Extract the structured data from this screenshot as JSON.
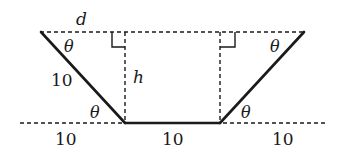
{
  "diagram": {
    "type": "geometry-trapezoid",
    "labels": {
      "top_width": "d",
      "height": "h",
      "slant_side": "10",
      "angle_top_left": "θ",
      "angle_bottom_left": "θ",
      "angle_top_right": "θ",
      "angle_bottom_right": "θ",
      "bottom_left_segment": "10",
      "bottom_middle_segment": "10",
      "bottom_right_segment": "10"
    },
    "colors": {
      "stroke": "#1a1a1a",
      "background": "#ffffff"
    }
  }
}
